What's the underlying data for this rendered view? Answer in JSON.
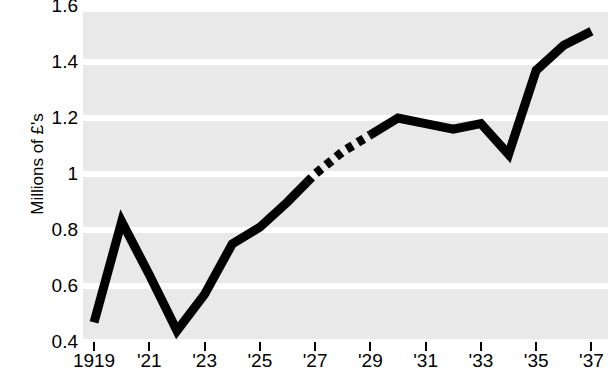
{
  "chart_data": {
    "type": "line",
    "title": "",
    "subtitle": "",
    "xlabel": "",
    "ylabel": "Millions of £'s",
    "xlim": [
      1918.6,
      1937.6
    ],
    "ylim": [
      0.4,
      1.6
    ],
    "grid": true,
    "legend_position": "none",
    "plot_background": "#e9e9e9",
    "gridline_color": "#ffffff",
    "line_color": "#000000",
    "line_width_px": 9,
    "x": [
      1919,
      1920,
      1921,
      1922,
      1923,
      1924,
      1925,
      1926,
      1927,
      1928,
      1929,
      1930,
      1931,
      1932,
      1933,
      1934,
      1935,
      1936,
      1937
    ],
    "values": [
      0.47,
      0.83,
      0.64,
      0.44,
      0.57,
      0.75,
      0.81,
      0.9,
      1.0,
      1.08,
      1.14,
      1.2,
      1.18,
      1.16,
      1.18,
      1.07,
      1.37,
      1.46,
      1.51
    ],
    "dashed_segment": {
      "from_year": 1926.7,
      "to_year": 1929.0,
      "note": "estimated / interpolated portion drawn as dashes"
    },
    "y_ticks": [
      {
        "value": 0.4,
        "label": "0.4"
      },
      {
        "value": 0.6,
        "label": "0.6"
      },
      {
        "value": 0.8,
        "label": "0.8"
      },
      {
        "value": 1.0,
        "label": "1"
      },
      {
        "value": 1.2,
        "label": "1.2"
      },
      {
        "value": 1.4,
        "label": "1.4"
      },
      {
        "value": 1.6,
        "label": "1.6"
      }
    ],
    "x_ticks": [
      {
        "value": 1919,
        "label": "1919"
      },
      {
        "value": 1921,
        "label": "'21"
      },
      {
        "value": 1923,
        "label": "'23"
      },
      {
        "value": 1925,
        "label": "'25"
      },
      {
        "value": 1927,
        "label": "'27"
      },
      {
        "value": 1929,
        "label": "'29"
      },
      {
        "value": 1931,
        "label": "'31"
      },
      {
        "value": 1933,
        "label": "'33"
      },
      {
        "value": 1935,
        "label": "'35"
      },
      {
        "value": 1937,
        "label": "'37"
      }
    ]
  },
  "axes": {
    "y_title": "Millions of £'s"
  }
}
